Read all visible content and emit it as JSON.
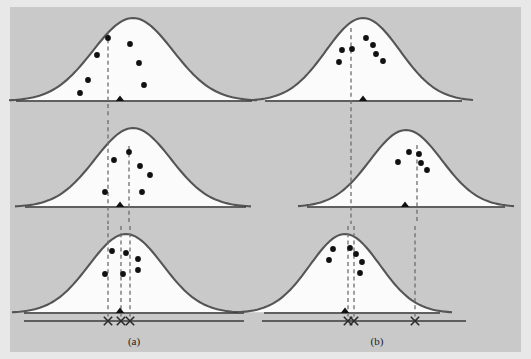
{
  "figure": {
    "background_color": "#c9c9c9",
    "outer_color": "#e8e8e8",
    "curve_stroke": "#555555",
    "curve_fill": "#fbfbfb",
    "dash_color": "#6d6d6d",
    "dot_color": "#111111"
  },
  "labels": {
    "left_column": "(a)",
    "right_column": "(b)"
  },
  "chart_data": {
    "type": "scatter",
    "xlabel": "",
    "ylabel": "",
    "grid": false,
    "legend": "none",
    "columns": [
      {
        "name": "(a)",
        "label": "(a)",
        "label_x": 134,
        "label_y": 345
      },
      {
        "name": "(b)",
        "label": "(b)",
        "label_x": 377,
        "label_y": 345
      }
    ],
    "panels": [
      {
        "id": "a1",
        "column": "(a)",
        "row": 1,
        "curve": {
          "center_x": 133,
          "peak_y": 18,
          "baseline_y": 101,
          "half_width": 124,
          "sigma": 40
        },
        "axis": {
          "x1": 16,
          "x2": 252,
          "y": 101
        },
        "true_mean_marker": {
          "type": "triangle",
          "x": 120,
          "y": 101
        },
        "estimate_lines": [
          {
            "x": 108,
            "y_top": 32,
            "y_bottom": 118
          }
        ],
        "points": [
          {
            "x": 108,
            "y": 38
          },
          {
            "x": 130,
            "y": 44
          },
          {
            "x": 97,
            "y": 55
          },
          {
            "x": 139,
            "y": 63
          },
          {
            "x": 88,
            "y": 80
          },
          {
            "x": 144,
            "y": 85
          },
          {
            "x": 80,
            "y": 93
          }
        ]
      },
      {
        "id": "a2",
        "column": "(a)",
        "row": 2,
        "curve": {
          "center_x": 133,
          "peak_y": 128,
          "baseline_y": 207,
          "half_width": 118,
          "sigma": 38
        },
        "axis": {
          "x1": 25,
          "x2": 246,
          "y": 207
        },
        "true_mean_marker": {
          "type": "triangle",
          "x": 120,
          "y": 207
        },
        "estimate_lines": [
          {
            "x": 108,
            "y_top": 120,
            "y_bottom": 224
          },
          {
            "x": 129,
            "y_top": 146,
            "y_bottom": 224
          }
        ],
        "points": [
          {
            "x": 129,
            "y": 152
          },
          {
            "x": 114,
            "y": 160
          },
          {
            "x": 140,
            "y": 166
          },
          {
            "x": 150,
            "y": 175
          },
          {
            "x": 105,
            "y": 192
          },
          {
            "x": 142,
            "y": 192
          }
        ]
      },
      {
        "id": "a3",
        "column": "(a)",
        "row": 3,
        "curve": {
          "center_x": 126,
          "peak_y": 234,
          "baseline_y": 313,
          "half_width": 114,
          "sigma": 37
        },
        "axis": {
          "x1": 24,
          "x2": 244,
          "y": 313
        },
        "summary_axis": {
          "x1": 24,
          "x2": 244,
          "y": 321
        },
        "true_mean_marker": {
          "type": "triangle",
          "x": 120,
          "y": 313
        },
        "estimate_lines": [
          {
            "x": 108,
            "y_top": 226,
            "y_bottom": 321
          },
          {
            "x": 121,
            "y_top": 226,
            "y_bottom": 321
          },
          {
            "x": 130,
            "y_top": 226,
            "y_bottom": 321
          }
        ],
        "x_markers": [
          {
            "x": 108,
            "y": 321
          },
          {
            "x": 121,
            "y": 321
          },
          {
            "x": 130,
            "y": 321
          }
        ],
        "points": [
          {
            "x": 112,
            "y": 251
          },
          {
            "x": 126,
            "y": 253
          },
          {
            "x": 138,
            "y": 259
          },
          {
            "x": 138,
            "y": 270
          },
          {
            "x": 105,
            "y": 274
          },
          {
            "x": 123,
            "y": 274
          }
        ]
      },
      {
        "id": "b1",
        "column": "(b)",
        "row": 1,
        "curve": {
          "center_x": 363,
          "peak_y": 18,
          "baseline_y": 101,
          "half_width": 110,
          "sigma": 37
        },
        "axis": {
          "x1": 265,
          "x2": 462,
          "y": 101
        },
        "true_mean_marker": {
          "type": "triangle",
          "x": 363,
          "y": 101
        },
        "estimate_lines": [
          {
            "x": 351,
            "y_top": 28,
            "y_bottom": 118
          }
        ],
        "points": [
          {
            "x": 366,
            "y": 38
          },
          {
            "x": 373,
            "y": 45
          },
          {
            "x": 342,
            "y": 50
          },
          {
            "x": 352,
            "y": 49
          },
          {
            "x": 376,
            "y": 54
          },
          {
            "x": 339,
            "y": 62
          },
          {
            "x": 383,
            "y": 61
          }
        ]
      },
      {
        "id": "b2",
        "column": "(b)",
        "row": 2,
        "curve": {
          "center_x": 406,
          "peak_y": 130,
          "baseline_y": 207,
          "half_width": 108,
          "sigma": 36
        },
        "axis": {
          "x1": 307,
          "x2": 505,
          "y": 207
        },
        "true_mean_marker": {
          "type": "triangle",
          "x": 405,
          "y": 207
        },
        "estimate_lines": [
          {
            "x": 351,
            "y_top": 120,
            "y_bottom": 224
          },
          {
            "x": 417,
            "y_top": 145,
            "y_bottom": 224
          }
        ],
        "points": [
          {
            "x": 409,
            "y": 152
          },
          {
            "x": 419,
            "y": 154
          },
          {
            "x": 398,
            "y": 162
          },
          {
            "x": 421,
            "y": 163
          },
          {
            "x": 427,
            "y": 170
          }
        ]
      },
      {
        "id": "b3",
        "column": "(b)",
        "row": 3,
        "curve": {
          "center_x": 345,
          "peak_y": 234,
          "baseline_y": 313,
          "half_width": 107,
          "sigma": 35
        },
        "axis": {
          "x1": 264,
          "x2": 440,
          "y": 313
        },
        "summary_axis": {
          "x1": 262,
          "x2": 466,
          "y": 321
        },
        "true_mean_marker": {
          "type": "triangle",
          "x": 345,
          "y": 313
        },
        "estimate_lines": [
          {
            "x": 348,
            "y_top": 226,
            "y_bottom": 321
          },
          {
            "x": 354,
            "y_top": 226,
            "y_bottom": 321
          },
          {
            "x": 415,
            "y_top": 226,
            "y_bottom": 321
          }
        ],
        "x_markers": [
          {
            "x": 348,
            "y": 321
          },
          {
            "x": 354,
            "y": 321
          },
          {
            "x": 415,
            "y": 321
          }
        ],
        "points": [
          {
            "x": 333,
            "y": 249
          },
          {
            "x": 350,
            "y": 248
          },
          {
            "x": 356,
            "y": 254
          },
          {
            "x": 329,
            "y": 260
          },
          {
            "x": 362,
            "y": 262
          },
          {
            "x": 360,
            "y": 273
          }
        ]
      }
    ]
  }
}
